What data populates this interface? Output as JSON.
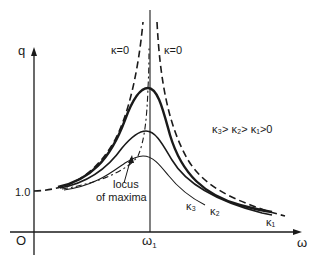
{
  "figure": {
    "axes": {
      "y_label": "q",
      "x_label": "ω",
      "origin_label": "O",
      "y_tick_label": "1.0",
      "x_tick_label": "ω₁",
      "x_tick_main": "ω",
      "x_tick_sub": "1"
    },
    "curve_labels": {
      "kappa0_left": "κ=0",
      "kappa0_right": "κ=0",
      "kappa3": "κ₃",
      "kappa2": "κ₂",
      "kappa1": "κ₁",
      "locus_line1": "locus",
      "locus_line2": "of maxima"
    },
    "inequality": "κ₃> κ₂> κ₁>0",
    "colors": {
      "ink": "#1a1a1a",
      "background": "#ffffff"
    }
  }
}
